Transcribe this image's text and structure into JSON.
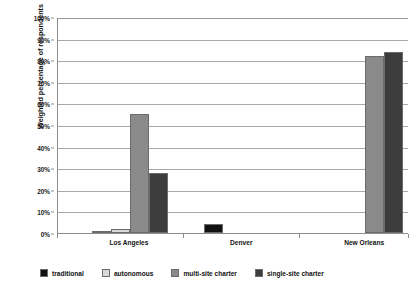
{
  "chart_data": {
    "type": "bar",
    "title": "",
    "subtitle": "",
    "xlabel": "",
    "ylabel": "Weighted percentage of respondents",
    "ylim": [
      0,
      100
    ],
    "y_tick_labels": [
      "0%",
      "10%",
      "20%",
      "30%",
      "40%",
      "50%",
      "60%",
      "70%",
      "80%",
      "90%",
      "100%"
    ],
    "y_tick_values": [
      0,
      10,
      20,
      30,
      40,
      50,
      60,
      70,
      80,
      90,
      100
    ],
    "grid": "horizontal",
    "legend_position": "bottom",
    "categories": [
      "Los Angeles",
      "Denver",
      "New Orleans"
    ],
    "series": [
      {
        "name": "traditional",
        "color": "#111111",
        "values": [
          1,
          4,
          0
        ]
      },
      {
        "name": "autonomous",
        "color": "#d9d9d9",
        "values": [
          2,
          0,
          0
        ]
      },
      {
        "name": "multi-site charter",
        "color": "#8a8a8a",
        "values": [
          55,
          0,
          82
        ]
      },
      {
        "name": "single-site charter",
        "color": "#3d3d3d",
        "values": [
          28,
          0,
          84
        ]
      }
    ]
  },
  "axis": {
    "y_title": "Weighted percentage of respondents"
  },
  "colors": {
    "gridline": "#a8a8a8",
    "axis": "#8d8d8d",
    "background": "#ffffff",
    "text": "#111111"
  }
}
